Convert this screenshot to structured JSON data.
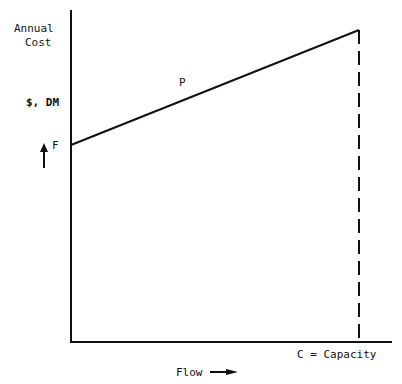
{
  "diagram": {
    "y_axis_title_line1": "Annual",
    "y_axis_title_line2": "Cost",
    "y_unit": "$, DM",
    "fixed_cost_label": "F",
    "line_label": "P",
    "capacity_label": "C = Capacity",
    "x_axis_label": "Flow",
    "colors": {
      "ink": "#111111",
      "background": "#ffffff"
    }
  }
}
